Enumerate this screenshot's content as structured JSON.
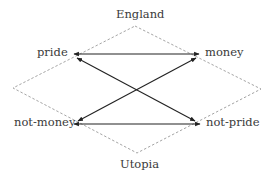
{
  "diagram": {
    "type": "square-of-opposition",
    "colors": {
      "edge": "#222222",
      "frame": "#9a9a9a",
      "text": "#3a3a3a"
    },
    "frame": {
      "top_label": "England",
      "bottom_label": "Utopia",
      "style": "dashed"
    },
    "nodes": {
      "top_left": "pride",
      "top_right": "money",
      "bottom_left": "not-money",
      "bottom_right": "not-pride"
    },
    "edges": [
      {
        "from": "pride",
        "to": "money",
        "arrows": "both"
      },
      {
        "from": "not-money",
        "to": "not-pride",
        "arrows": "both"
      },
      {
        "from": "pride",
        "to": "not-pride",
        "arrows": "both"
      },
      {
        "from": "money",
        "to": "not-money",
        "arrows": "both"
      }
    ]
  }
}
